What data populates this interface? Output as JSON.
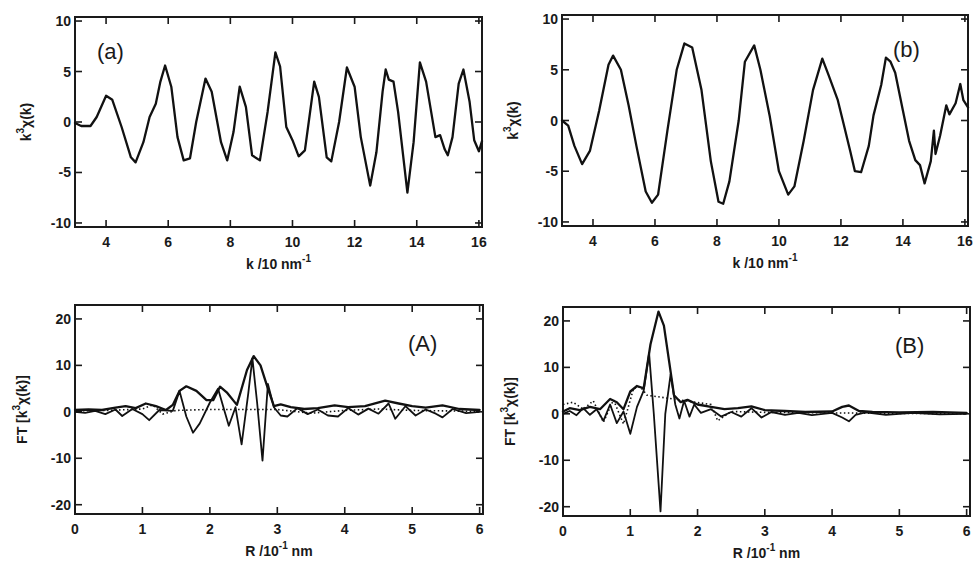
{
  "chart_data": [
    {
      "id": "a",
      "type": "line",
      "panel_label": "(a)",
      "title": "",
      "xlabel": "k /10 nm",
      "xlabel_sup": "-1",
      "ylabel": "k",
      "ylabel_sup": "3",
      "ylabel_rest": "χ(k)",
      "xlim": [
        3,
        16.1
      ],
      "ylim": [
        -10.4,
        10.4
      ],
      "xticks": [
        4,
        6,
        8,
        10,
        12,
        14,
        16
      ],
      "yticks": [
        -10,
        -5,
        0,
        5,
        10
      ],
      "grid": false,
      "box": {
        "left": 75,
        "top": 17,
        "right": 482,
        "bottom": 227
      },
      "series": [
        {
          "name": "k3chi",
          "style": "solid",
          "x": [
            3.0,
            3.2,
            3.5,
            3.7,
            4.0,
            4.2,
            4.5,
            4.8,
            4.95,
            5.2,
            5.4,
            5.6,
            5.75,
            5.9,
            6.1,
            6.3,
            6.5,
            6.7,
            6.9,
            7.2,
            7.4,
            7.7,
            7.9,
            8.1,
            8.3,
            8.5,
            8.7,
            8.95,
            9.2,
            9.45,
            9.6,
            9.8,
            10.0,
            10.2,
            10.4,
            10.7,
            10.85,
            11.1,
            11.25,
            11.5,
            11.75,
            12.0,
            12.2,
            12.5,
            12.7,
            12.9,
            13.0,
            13.1,
            13.25,
            13.4,
            13.7,
            13.9,
            14.1,
            14.3,
            14.6,
            14.75,
            14.9,
            15.0,
            15.15,
            15.35,
            15.5,
            15.7,
            15.85,
            16.0,
            16.1
          ],
          "values": [
            -0.1,
            -0.4,
            -0.4,
            0.5,
            2.6,
            2.2,
            -0.5,
            -3.5,
            -4.0,
            -2.0,
            0.5,
            1.8,
            4.0,
            5.6,
            3.5,
            -1.5,
            -3.8,
            -3.6,
            0.0,
            4.3,
            3.0,
            -2.0,
            -3.8,
            -1.0,
            3.5,
            1.5,
            -3.3,
            -3.8,
            1.0,
            6.9,
            5.5,
            -0.5,
            -1.8,
            -3.4,
            -2.8,
            4.0,
            2.5,
            -3.5,
            -3.9,
            0.0,
            5.4,
            3.5,
            -1.5,
            -6.3,
            -3.0,
            3.0,
            5.2,
            4.2,
            4.0,
            1.0,
            -7.0,
            -2.0,
            5.9,
            4.0,
            -1.5,
            -1.3,
            -2.7,
            -3.3,
            -1.5,
            3.8,
            5.2,
            2.0,
            -1.8,
            -2.9,
            -1.9
          ]
        }
      ]
    },
    {
      "id": "b",
      "type": "line",
      "panel_label": "(b)",
      "title": "",
      "xlabel": "k /10 nm",
      "xlabel_sup": "-1",
      "ylabel": "k",
      "ylabel_sup": "3",
      "ylabel_rest": "χ(k)",
      "xlim": [
        3,
        16.1
      ],
      "ylim": [
        -10.4,
        10.4
      ],
      "xticks": [
        4,
        6,
        8,
        10,
        12,
        14,
        16
      ],
      "yticks": [
        -10,
        -5,
        0,
        5,
        10
      ],
      "grid": false,
      "box": {
        "left": 562,
        "top": 15,
        "right": 968,
        "bottom": 226
      },
      "series": [
        {
          "name": "k3chi",
          "style": "solid",
          "x": [
            3.0,
            3.2,
            3.4,
            3.65,
            3.9,
            4.2,
            4.5,
            4.65,
            4.9,
            5.15,
            5.4,
            5.7,
            5.9,
            6.1,
            6.4,
            6.7,
            6.95,
            7.2,
            7.5,
            7.8,
            8.05,
            8.2,
            8.4,
            8.7,
            8.9,
            9.2,
            9.4,
            9.7,
            10.0,
            10.3,
            10.5,
            10.8,
            11.1,
            11.4,
            11.6,
            11.9,
            12.1,
            12.3,
            12.45,
            12.65,
            12.9,
            13.05,
            13.3,
            13.45,
            13.6,
            13.75,
            14.0,
            14.2,
            14.4,
            14.55,
            14.7,
            14.9,
            15.0,
            15.05,
            15.2,
            15.4,
            15.5,
            15.7,
            15.85,
            15.95,
            16.1
          ],
          "values": [
            0.0,
            -0.5,
            -2.5,
            -4.3,
            -3.0,
            1.0,
            5.5,
            6.4,
            5.0,
            1.5,
            -2.5,
            -7.0,
            -8.1,
            -7.3,
            -1.0,
            5.0,
            7.6,
            7.2,
            3.0,
            -4.0,
            -8.0,
            -8.2,
            -6.0,
            0.0,
            5.8,
            7.4,
            5.0,
            0.5,
            -5.0,
            -7.3,
            -6.5,
            -2.0,
            3.0,
            6.1,
            4.5,
            2.0,
            -0.5,
            -3.0,
            -5.0,
            -5.1,
            -2.5,
            0.5,
            3.5,
            6.2,
            5.8,
            4.7,
            1.0,
            -2.0,
            -3.9,
            -4.4,
            -6.2,
            -4.0,
            -1.0,
            -3.3,
            -1.5,
            1.5,
            0.6,
            1.7,
            3.6,
            2.0,
            1.3
          ]
        }
      ]
    },
    {
      "id": "A",
      "type": "line",
      "panel_label": "(A)",
      "title": "",
      "xlabel": "R /10",
      "xlabel_sup": "-1",
      "xlabel_rest": " nm",
      "ylabel": "FT [k",
      "ylabel_sup": "3",
      "ylabel_rest": "χ(k)]",
      "xlim": [
        0,
        6.05
      ],
      "ylim": [
        -22,
        23
      ],
      "xticks": [
        0,
        1,
        2,
        3,
        4,
        5,
        6
      ],
      "yticks": [
        -20,
        -10,
        0,
        10,
        20
      ],
      "grid": false,
      "box": {
        "left": 75,
        "top": 305,
        "right": 483,
        "bottom": 514
      },
      "series": [
        {
          "name": "magnitude",
          "style": "solid",
          "x": [
            0.0,
            0.2,
            0.4,
            0.6,
            0.75,
            0.9,
            1.05,
            1.2,
            1.35,
            1.45,
            1.55,
            1.65,
            1.8,
            1.95,
            2.05,
            2.15,
            2.25,
            2.4,
            2.55,
            2.65,
            2.75,
            2.85,
            2.95,
            3.05,
            3.2,
            3.4,
            3.6,
            3.85,
            4.05,
            4.3,
            4.6,
            4.8,
            5.0,
            5.2,
            5.45,
            5.7,
            6.0
          ],
          "values": [
            0.4,
            0.5,
            0.4,
            0.9,
            1.2,
            0.8,
            1.8,
            1.2,
            0.4,
            1.5,
            4.5,
            5.5,
            4.5,
            2.5,
            2.5,
            5.4,
            4.2,
            1.5,
            9.0,
            12.0,
            10.0,
            5.5,
            1.2,
            1.6,
            1.0,
            0.6,
            0.8,
            1.4,
            1.0,
            1.2,
            2.4,
            1.8,
            1.2,
            0.9,
            1.4,
            0.6,
            0.4
          ]
        },
        {
          "name": "imaginary",
          "style": "thin",
          "x": [
            0.0,
            0.15,
            0.3,
            0.45,
            0.6,
            0.7,
            0.85,
            1.0,
            1.1,
            1.25,
            1.45,
            1.55,
            1.65,
            1.75,
            1.85,
            2.0,
            2.12,
            2.2,
            2.28,
            2.38,
            2.47,
            2.57,
            2.63,
            2.7,
            2.78,
            2.86,
            2.95,
            3.05,
            3.15,
            3.3,
            3.45,
            3.6,
            3.75,
            3.9,
            4.05,
            4.2,
            4.35,
            4.5,
            4.65,
            4.75,
            4.9,
            5.05,
            5.2,
            5.35,
            5.45,
            5.6,
            5.8,
            6.0
          ],
          "values": [
            0.0,
            -0.2,
            0.2,
            -0.5,
            0.5,
            -0.9,
            0.6,
            -0.5,
            -1.8,
            0.4,
            0.2,
            4.5,
            -1.0,
            -4.5,
            -2.5,
            2.0,
            5.0,
            1.0,
            -3.0,
            1.0,
            -7.0,
            4.0,
            11.5,
            2.0,
            -10.5,
            6.0,
            1.0,
            -0.8,
            -1.0,
            0.8,
            -0.5,
            0.5,
            -0.8,
            -1.0,
            0.8,
            -0.6,
            0.7,
            -0.4,
            1.8,
            -1.5,
            1.2,
            -0.8,
            0.5,
            -0.4,
            -1.2,
            0.6,
            -0.3,
            0.0
          ]
        },
        {
          "name": "fit",
          "style": "dotted",
          "x": [
            0.0,
            0.5,
            1.0,
            1.15,
            1.3,
            1.5,
            2.0,
            3.0,
            3.5,
            4.0,
            4.5,
            5.0,
            5.5,
            6.0
          ],
          "values": [
            0.2,
            0.3,
            0.6,
            1.5,
            -0.5,
            0.3,
            0.5,
            0.5,
            -0.3,
            0.3,
            0.6,
            0.3,
            0.2,
            0.1
          ]
        }
      ]
    },
    {
      "id": "B",
      "type": "line",
      "panel_label": "(B)",
      "title": "",
      "xlabel": "R /10",
      "xlabel_sup": "-1",
      "xlabel_rest": " nm",
      "ylabel": "FT [k",
      "ylabel_sup": "3",
      "ylabel_rest": "χ(k)]",
      "xlim": [
        0,
        6.05
      ],
      "ylim": [
        -22,
        23
      ],
      "xticks": [
        0,
        1,
        2,
        3,
        4,
        5,
        6
      ],
      "yticks": [
        -20,
        -10,
        0,
        10,
        20
      ],
      "grid": false,
      "box": {
        "left": 563,
        "top": 307,
        "right": 970,
        "bottom": 516
      },
      "series": [
        {
          "name": "magnitude",
          "style": "solid",
          "x": [
            0.0,
            0.1,
            0.25,
            0.4,
            0.55,
            0.7,
            0.8,
            0.9,
            1.0,
            1.1,
            1.2,
            1.3,
            1.42,
            1.5,
            1.58,
            1.65,
            1.75,
            1.85,
            2.0,
            2.2,
            2.4,
            2.6,
            2.8,
            3.0,
            3.3,
            3.6,
            4.0,
            4.15,
            4.25,
            4.4,
            4.6,
            5.0,
            5.5,
            6.0
          ],
          "values": [
            0.5,
            1.2,
            0.8,
            1.5,
            1.0,
            3.2,
            2.5,
            1.0,
            4.8,
            6.0,
            5.5,
            15.0,
            22.0,
            19.0,
            11.0,
            4.0,
            2.5,
            3.0,
            2.0,
            1.5,
            1.0,
            1.2,
            1.6,
            0.8,
            0.6,
            0.4,
            0.5,
            1.5,
            1.8,
            0.6,
            0.4,
            0.3,
            0.4,
            0.2
          ]
        },
        {
          "name": "imaginary",
          "style": "thin",
          "x": [
            0.0,
            0.1,
            0.2,
            0.3,
            0.4,
            0.5,
            0.6,
            0.7,
            0.8,
            0.9,
            1.0,
            1.1,
            1.2,
            1.28,
            1.35,
            1.45,
            1.52,
            1.6,
            1.67,
            1.73,
            1.8,
            1.88,
            1.95,
            2.05,
            2.2,
            2.35,
            2.5,
            2.65,
            2.8,
            2.95,
            3.1,
            3.3,
            3.5,
            3.7,
            4.0,
            4.15,
            4.25,
            4.35,
            4.5,
            4.8,
            5.2,
            5.6,
            6.0
          ],
          "values": [
            0.0,
            0.6,
            -0.3,
            1.2,
            -0.2,
            1.0,
            -1.5,
            2.0,
            -2.0,
            0.5,
            -4.3,
            1.5,
            5.0,
            13.0,
            0.0,
            -21.0,
            0.0,
            8.5,
            2.0,
            -1.0,
            2.8,
            -0.6,
            2.0,
            0.2,
            1.0,
            -0.6,
            0.4,
            -0.6,
            1.2,
            -0.8,
            0.4,
            -0.2,
            0.2,
            -0.3,
            0.2,
            -0.8,
            -1.6,
            -0.2,
            0.3,
            -0.2,
            0.2,
            -0.1,
            0.0
          ]
        },
        {
          "name": "fit",
          "style": "dotted",
          "x": [
            0.0,
            0.15,
            0.3,
            0.45,
            0.6,
            0.75,
            0.9,
            1.05,
            1.15,
            1.25,
            2.2,
            2.3,
            2.5,
            3.0,
            4.0,
            5.0,
            6.0
          ],
          "values": [
            2.0,
            2.5,
            1.0,
            2.8,
            -1.8,
            3.0,
            -2.2,
            5.5,
            5.8,
            4.0,
            2.0,
            -1.5,
            0.5,
            0.3,
            0.2,
            0.1,
            0.0
          ]
        }
      ]
    }
  ]
}
